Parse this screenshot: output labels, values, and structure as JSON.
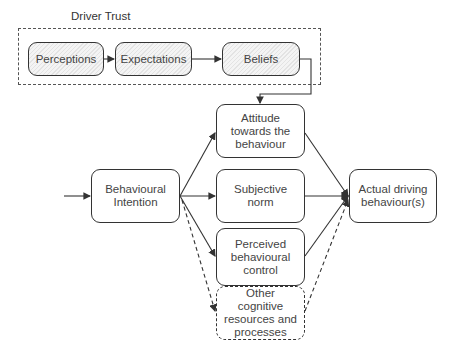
{
  "group": {
    "label": "Driver Trust"
  },
  "nodes": {
    "perceptions": "Perceptions",
    "expectations": "Expectations",
    "beliefs": "Beliefs",
    "attitude": "Attitude towards the behaviour",
    "subjective_norm": "Subjective norm",
    "perceived_control": "Perceived behavioural control",
    "other": "Other cognitive resources and processes",
    "intention": "Behavioural Intention",
    "actual": "Actual driving behaviour(s)"
  },
  "colors": {
    "stroke": "#333333",
    "hatch_light": "#f4f4f4",
    "hatch_dark": "#e3e3e3"
  }
}
